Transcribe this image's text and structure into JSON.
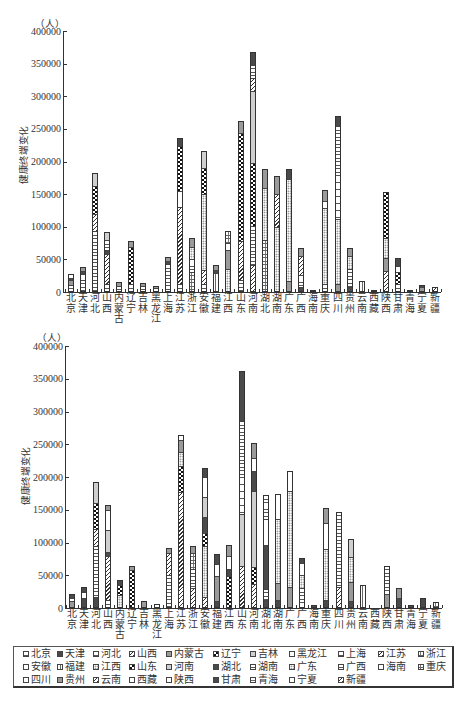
{
  "chart_data": [
    {
      "type": "bar",
      "stacked": true,
      "title": "",
      "ylabel": "健康终端变化",
      "yunit": "（人）",
      "xlabel": "",
      "ylim": [
        0,
        400000
      ],
      "grid": false,
      "legend_position": "bottom",
      "yticks": [
        "0",
        "50000",
        "100000",
        "150000",
        "200000",
        "250000",
        "300000",
        "350000",
        "400000"
      ],
      "categories": [
        "北京",
        "天津",
        "河北",
        "山西",
        "内蒙古",
        "辽宁",
        "吉林",
        "黑龙江",
        "上海",
        "江苏",
        "浙江",
        "安徽",
        "福建",
        "江西",
        "山东",
        "河南",
        "湖北",
        "湖南",
        "广东",
        "广西",
        "海南",
        "重庆",
        "四川",
        "贵州",
        "云南",
        "西藏",
        "陕西",
        "甘肃",
        "青海",
        "宁夏",
        "新疆"
      ],
      "values": [
        28000,
        38000,
        183000,
        92000,
        16000,
        78000,
        14000,
        9000,
        53000,
        236000,
        82000,
        216000,
        42000,
        93000,
        262000,
        368000,
        188000,
        178000,
        188000,
        68000,
        3000,
        156000,
        270000,
        67000,
        17000,
        1000,
        154000,
        52000,
        1000,
        11000,
        7000
      ],
      "segments": [
        [
          [
            "hline",
            10000
          ],
          [
            "grey",
            8000
          ],
          [
            "dark",
            4000
          ],
          [
            "hline",
            6000
          ]
        ],
        [
          [
            "hline",
            20000
          ],
          [
            "white",
            8000
          ],
          [
            "dark",
            4000
          ],
          [
            "grey",
            6000
          ]
        ],
        [
          [
            "hline",
            95000
          ],
          [
            "diag",
            25000
          ],
          [
            "checker",
            43000
          ],
          [
            "ltgrey",
            20000
          ]
        ],
        [
          [
            "hline",
            10000
          ],
          [
            "diag",
            50000
          ],
          [
            "dark",
            5000
          ],
          [
            "hline",
            15000
          ],
          [
            "ltgrey",
            12000
          ]
        ],
        [
          [
            "hline",
            8000
          ],
          [
            "grey",
            8000
          ]
        ],
        [
          [
            "hline",
            10000
          ],
          [
            "checker",
            60000
          ],
          [
            "grey",
            8000
          ]
        ],
        [
          [
            "hline",
            8000
          ],
          [
            "grey",
            6000
          ]
        ],
        [
          [
            "white",
            5000
          ],
          [
            "grey",
            4000
          ]
        ],
        [
          [
            "hline",
            45000
          ],
          [
            "dark",
            3000
          ],
          [
            "grey",
            5000
          ]
        ],
        [
          [
            "hline",
            10000
          ],
          [
            "diag",
            120000
          ],
          [
            "white",
            25000
          ],
          [
            "checker",
            70000
          ],
          [
            "dark",
            11000
          ]
        ],
        [
          [
            "cross",
            30000
          ],
          [
            "hline",
            20000
          ],
          [
            "dots",
            20000
          ],
          [
            "grey",
            12000
          ]
        ],
        [
          [
            "hline",
            10000
          ],
          [
            "diag",
            20000
          ],
          [
            "dots",
            120000
          ],
          [
            "checker",
            40000
          ],
          [
            "ltgrey",
            26000
          ]
        ],
        [
          [
            "vline",
            30000
          ],
          [
            "dark",
            4000
          ],
          [
            "grey",
            8000
          ]
        ],
        [
          [
            "dots",
            35000
          ],
          [
            "grey",
            30000
          ],
          [
            "white",
            10000
          ],
          [
            "cross",
            18000
          ]
        ],
        [
          [
            "hline",
            15000
          ],
          [
            "diag",
            60000
          ],
          [
            "checker",
            170000
          ],
          [
            "grey",
            17000
          ]
        ],
        [
          [
            "diag",
            40000
          ],
          [
            "hline",
            60000
          ],
          [
            "checker",
            98000
          ],
          [
            "ltgrey",
            112000
          ],
          [
            "diag",
            20000
          ],
          [
            "hline",
            18000
          ],
          [
            "dark",
            20000
          ]
        ],
        [
          [
            "cross",
            80000
          ],
          [
            "dots",
            80000
          ],
          [
            "grey",
            28000
          ]
        ],
        [
          [
            "dots",
            100000
          ],
          [
            "diag",
            50000
          ],
          [
            "grey",
            28000
          ]
        ],
        [
          [
            "grey",
            15000
          ],
          [
            "dots",
            160000
          ],
          [
            "dark",
            13000
          ]
        ],
        [
          [
            "dark",
            5000
          ],
          [
            "hline",
            20000
          ],
          [
            "diag",
            30000
          ],
          [
            "grey",
            13000
          ]
        ],
        [
          [
            "grey",
            3000
          ]
        ],
        [
          [
            "hline",
            10000
          ],
          [
            "dots",
            120000
          ],
          [
            "white",
            10000
          ],
          [
            "grey",
            16000
          ]
        ],
        [
          [
            "grey",
            10000
          ],
          [
            "dots",
            100000
          ],
          [
            "hline",
            145000
          ],
          [
            "dark",
            15000
          ]
        ],
        [
          [
            "dark",
            5000
          ],
          [
            "hline",
            30000
          ],
          [
            "dots",
            20000
          ],
          [
            "grey",
            12000
          ]
        ],
        [
          [
            "vline",
            17000
          ]
        ],
        [
          [
            "grey",
            1000
          ]
        ],
        [
          [
            "diag",
            30000
          ],
          [
            "grey",
            20000
          ],
          [
            "dots",
            30000
          ],
          [
            "checker",
            74000
          ]
        ],
        [
          [
            "hline",
            10000
          ],
          [
            "checker",
            20000
          ],
          [
            "white",
            10000
          ],
          [
            "dark",
            12000
          ]
        ],
        [
          [
            "grey",
            1000
          ]
        ],
        [
          [
            "grey",
            7000
          ],
          [
            "dark",
            4000
          ]
        ],
        [
          [
            "diag",
            7000
          ]
        ]
      ]
    },
    {
      "type": "bar",
      "stacked": true,
      "title": "",
      "ylabel": "健康终端变化",
      "yunit": "（人）",
      "xlabel": "",
      "ylim": [
        0,
        400000
      ],
      "grid": false,
      "legend_position": "bottom",
      "yticks": [
        "0",
        "50000",
        "100000",
        "150000",
        "200000",
        "250000",
        "300000",
        "350000",
        "400000"
      ],
      "categories": [
        "北京",
        "天津",
        "河北",
        "山西",
        "内蒙古",
        "辽宁",
        "吉林",
        "黑龙江",
        "上海",
        "江苏",
        "浙江",
        "安徽",
        "福建",
        "江西",
        "山东",
        "河南",
        "湖北",
        "湖南",
        "广东",
        "广西",
        "海南",
        "重庆",
        "四川",
        "贵州",
        "云南",
        "西藏",
        "陕西",
        "甘肃",
        "青海",
        "宁夏",
        "新疆"
      ],
      "values": [
        21000,
        32000,
        193000,
        158000,
        43000,
        64000,
        11000,
        6000,
        91000,
        264000,
        94000,
        214000,
        82000,
        96000,
        362000,
        252000,
        173000,
        174000,
        209000,
        77000,
        5000,
        152000,
        146000,
        105000,
        35000,
        0,
        64000,
        30000,
        5000,
        15000,
        9000
      ],
      "segments": [
        [
          [
            "grey",
            10000
          ],
          [
            "white",
            5000
          ],
          [
            "dark",
            6000
          ]
        ],
        [
          [
            "dark",
            15000
          ],
          [
            "white",
            10000
          ],
          [
            "dark",
            7000
          ]
        ],
        [
          [
            "dark",
            15000
          ],
          [
            "hline",
            80000
          ],
          [
            "diag",
            25000
          ],
          [
            "checker",
            40000
          ],
          [
            "ltgrey",
            33000
          ]
        ],
        [
          [
            "hline",
            10000
          ],
          [
            "diag",
            70000
          ],
          [
            "dark",
            5000
          ],
          [
            "ltgrey",
            35000
          ],
          [
            "white",
            30000
          ],
          [
            "grey",
            8000
          ]
        ],
        [
          [
            "dots",
            20000
          ],
          [
            "checker",
            15000
          ],
          [
            "dark",
            8000
          ]
        ],
        [
          [
            "checker",
            60000
          ],
          [
            "grey",
            4000
          ]
        ],
        [
          [
            "grey",
            11000
          ]
        ],
        [
          [
            "white",
            6000
          ]
        ],
        [
          [
            "hline",
            50000
          ],
          [
            "diag",
            35000
          ],
          [
            "grey",
            6000
          ]
        ],
        [
          [
            "diag",
            180000
          ],
          [
            "checker",
            40000
          ],
          [
            "dots",
            20000
          ],
          [
            "grey",
            18000
          ],
          [
            "white",
            6000
          ]
        ],
        [
          [
            "diag",
            30000
          ],
          [
            "hline",
            30000
          ],
          [
            "cross",
            24000
          ],
          [
            "grey",
            10000
          ]
        ],
        [
          [
            "diag",
            15000
          ],
          [
            "dots",
            80000
          ],
          [
            "checker",
            20000
          ],
          [
            "dark",
            25000
          ],
          [
            "ltgrey",
            30000
          ],
          [
            "white",
            30000
          ],
          [
            "dark",
            14000
          ]
        ],
        [
          [
            "dark",
            8000
          ],
          [
            "grey",
            40000
          ],
          [
            "white",
            20000
          ],
          [
            "dark",
            14000
          ]
        ],
        [
          [
            "checker",
            50000
          ],
          [
            "dark",
            10000
          ],
          [
            "white",
            20000
          ],
          [
            "grey",
            16000
          ]
        ],
        [
          [
            "diag",
            62000
          ],
          [
            "ltgrey",
            80000
          ],
          [
            "hline",
            143000
          ],
          [
            "dark",
            77000
          ]
        ],
        [
          [
            "diag",
            35000
          ],
          [
            "checker",
            25000
          ],
          [
            "ltgrey",
            120000
          ],
          [
            "dark",
            30000
          ],
          [
            "white",
            20000
          ],
          [
            "grey",
            22000
          ]
        ],
        [
          [
            "dark",
            10000
          ],
          [
            "hline",
            15000
          ],
          [
            "dark",
            70000
          ],
          [
            "white",
            40000
          ],
          [
            "hline",
            38000
          ]
        ],
        [
          [
            "dark",
            10000
          ],
          [
            "grey",
            25000
          ],
          [
            "dots",
            100000
          ],
          [
            "white",
            39000
          ]
        ],
        [
          [
            "grey",
            30000
          ],
          [
            "dots",
            150000
          ],
          [
            "white",
            29000
          ]
        ],
        [
          [
            "hline",
            30000
          ],
          [
            "dots",
            20000
          ],
          [
            "white",
            20000
          ],
          [
            "dark",
            7000
          ]
        ],
        [
          [
            "dark",
            5000
          ]
        ],
        [
          [
            "dark",
            10000
          ],
          [
            "dots",
            80000
          ],
          [
            "white",
            40000
          ],
          [
            "grey",
            22000
          ]
        ],
        [
          [
            "diag",
            30000
          ],
          [
            "hline",
            116000
          ]
        ],
        [
          [
            "dark",
            8000
          ],
          [
            "grey",
            30000
          ],
          [
            "dots",
            40000
          ],
          [
            "ltgrey",
            27000
          ]
        ],
        [
          [
            "vline",
            35000
          ]
        ],
        [],
        [
          [
            "grey",
            20000
          ],
          [
            "hline",
            44000
          ]
        ],
        [
          [
            "dark",
            15000
          ],
          [
            "grey",
            15000
          ]
        ],
        [
          [
            "dark",
            5000
          ]
        ],
        [
          [
            "dark",
            15000
          ]
        ],
        [
          [
            "cross",
            9000
          ]
        ]
      ]
    }
  ],
  "legend": {
    "items": [
      {
        "label": "北京",
        "pattern": "hline"
      },
      {
        "label": "天津",
        "pattern": "dark"
      },
      {
        "label": "河北",
        "pattern": "hline"
      },
      {
        "label": "山西",
        "pattern": "diag"
      },
      {
        "label": "内蒙古",
        "pattern": "grey"
      },
      {
        "label": "辽宁",
        "pattern": "checker"
      },
      {
        "label": "吉林",
        "pattern": "ltgrey"
      },
      {
        "label": "黑龙江",
        "pattern": "white"
      },
      {
        "label": "上海",
        "pattern": "hline"
      },
      {
        "label": "江苏",
        "pattern": "diag"
      },
      {
        "label": "浙江",
        "pattern": "cross"
      },
      {
        "label": "安徽",
        "pattern": "white"
      },
      {
        "label": "福建",
        "pattern": "vline"
      },
      {
        "label": "江西",
        "pattern": "dots"
      },
      {
        "label": "山东",
        "pattern": "checker"
      },
      {
        "label": "河南",
        "pattern": "ltgrey"
      },
      {
        "label": "湖北",
        "pattern": "dark"
      },
      {
        "label": "湖南",
        "pattern": "hline"
      },
      {
        "label": "广东",
        "pattern": "dots"
      },
      {
        "label": "广西",
        "pattern": "hline"
      },
      {
        "label": "海南",
        "pattern": "white"
      },
      {
        "label": "重庆",
        "pattern": "cross"
      },
      {
        "label": "四川",
        "pattern": "white"
      },
      {
        "label": "贵州",
        "pattern": "grey"
      },
      {
        "label": "云南",
        "pattern": "diag"
      },
      {
        "label": "西藏",
        "pattern": "white"
      },
      {
        "label": "陕西",
        "pattern": "white"
      },
      {
        "label": "甘肃",
        "pattern": "dark"
      },
      {
        "label": "青海",
        "pattern": "cross"
      },
      {
        "label": "宁夏",
        "pattern": "white"
      },
      {
        "label": "新疆",
        "pattern": "diag"
      }
    ]
  }
}
